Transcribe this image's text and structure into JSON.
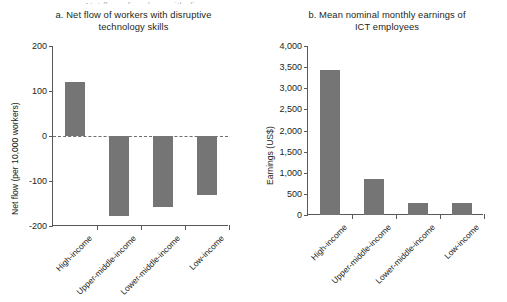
{
  "figure": {
    "cropped_top_text": "a. Net flow of workers with di"
  },
  "chart_data": [
    {
      "id": "a",
      "type": "bar",
      "title": "a. Net flow of workers with disruptive technology skills",
      "title_line1": "a. Net flow of workers with disruptive",
      "title_line2": "technology skills",
      "xlabel": "",
      "ylabel": "Net flow (per 10,000 workers)",
      "categories": [
        "High-income",
        "Upper-middle-income",
        "Lower-middle-income",
        "Low-income"
      ],
      "values": [
        120,
        -178,
        -157,
        -130
      ],
      "ylim": [
        -200,
        200
      ],
      "yticks": [
        200,
        100,
        0,
        -100,
        -200
      ],
      "ytick_labels": [
        "200",
        "100",
        "0",
        "-100",
        "-200"
      ],
      "grid": false,
      "zero_line": true,
      "legend": "none",
      "bar_color": "#757575"
    },
    {
      "id": "b",
      "type": "bar",
      "title": "b. Mean nominal monthly earnings of ICT employees",
      "title_line1": "b. Mean nominal monthly earnings of",
      "title_line2": "ICT employees",
      "xlabel": "",
      "ylabel": "Earnings (US$)",
      "categories": [
        "High-income",
        "Upper-middle-income",
        "Lower-middle-income",
        "Low-income"
      ],
      "values": [
        3440,
        850,
        280,
        275
      ],
      "ylim": [
        0,
        4000
      ],
      "yticks": [
        4000,
        3500,
        3000,
        2500,
        2000,
        1500,
        1000,
        500,
        0
      ],
      "ytick_labels": [
        "4,000",
        "3,500",
        "3,000",
        "2,500",
        "2,000",
        "1,500",
        "1,000",
        "500",
        "0"
      ],
      "grid": false,
      "zero_line": false,
      "legend": "none",
      "bar_color": "#757575"
    }
  ]
}
